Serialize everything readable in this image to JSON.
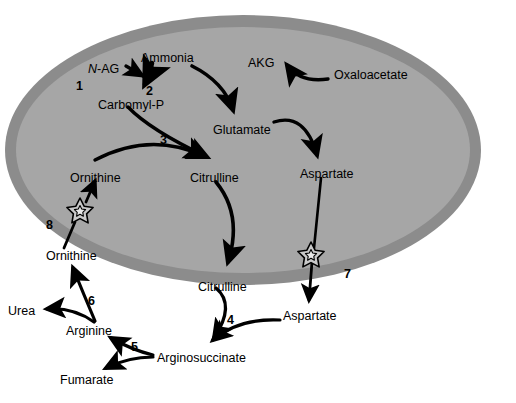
{
  "diagram": {
    "colors": {
      "membrane_outer": "#8c8c8c",
      "matrix_inner": "#a6a6a6",
      "star_fill": "#c9c9c9",
      "stroke": "#000000",
      "background": "#ffffff"
    },
    "organelle": {
      "name": "mitochondrion",
      "cx": 243,
      "cy": 150,
      "rx": 238,
      "ry": 135,
      "ring_thickness": 13
    },
    "metabolites_inside": [
      {
        "id": "n-ag",
        "label": "N-AG",
        "italic_prefix": "N",
        "rest": "-AG",
        "x": 88,
        "y": 63
      },
      {
        "id": "ammonia",
        "label": "Ammonia",
        "x": 141,
        "y": 52
      },
      {
        "id": "carbomyl-p",
        "label": "Carbomyl-P",
        "x": 98,
        "y": 99
      },
      {
        "id": "akg",
        "label": "AKG",
        "x": 248,
        "y": 57
      },
      {
        "id": "oxaloacetate",
        "label": "Oxaloacetate",
        "x": 334,
        "y": 69
      },
      {
        "id": "glutamate",
        "label": "Glutamate",
        "x": 213,
        "y": 124
      },
      {
        "id": "ornithine-in",
        "label": "Ornithine",
        "x": 70,
        "y": 172
      },
      {
        "id": "citrulline-in",
        "label": "Citrulline",
        "x": 190,
        "y": 172
      },
      {
        "id": "aspartate-in",
        "label": "Aspartate",
        "x": 300,
        "y": 168
      }
    ],
    "metabolites_outside": [
      {
        "id": "ornithine-out",
        "label": "Ornithine",
        "x": 46,
        "y": 250
      },
      {
        "id": "citrulline-out",
        "label": "Citrulline",
        "x": 198,
        "y": 281
      },
      {
        "id": "aspartate-out",
        "label": "Aspartate",
        "x": 283,
        "y": 310
      },
      {
        "id": "urea",
        "label": "Urea",
        "x": 8,
        "y": 305
      },
      {
        "id": "arginine",
        "label": "Arginine",
        "x": 66,
        "y": 325
      },
      {
        "id": "fumarate",
        "label": "Fumarate",
        "x": 60,
        "y": 374
      },
      {
        "id": "arginosuccinate",
        "label": "Arginosuccinate",
        "x": 157,
        "y": 352
      }
    ],
    "reaction_numbers": [
      {
        "id": "rxn-1",
        "label": "1",
        "x": 76,
        "y": 80,
        "meaning": "N-acetylglutamate synthase"
      },
      {
        "id": "rxn-2",
        "label": "2",
        "x": 146,
        "y": 85,
        "meaning": "carbamoyl phosphate synthetase I"
      },
      {
        "id": "rxn-3",
        "label": "3",
        "x": 160,
        "y": 134,
        "meaning": "ornithine transcarbamylase"
      },
      {
        "id": "rxn-4",
        "label": "4",
        "x": 227,
        "y": 314,
        "meaning": "argininosuccinate synthetase"
      },
      {
        "id": "rxn-5",
        "label": "5",
        "x": 131,
        "y": 341,
        "meaning": "argininosuccinate lyase"
      },
      {
        "id": "rxn-6",
        "label": "6",
        "x": 88,
        "y": 295,
        "meaning": "arginase"
      },
      {
        "id": "rxn-7",
        "label": "7",
        "x": 344,
        "y": 268,
        "meaning": "aspartate-glutamate carrier"
      },
      {
        "id": "rxn-8",
        "label": "8",
        "x": 46,
        "y": 219,
        "meaning": "ornithine-citrulline carrier"
      }
    ],
    "transporters": [
      {
        "id": "transporter-8",
        "x": 80,
        "y": 211,
        "r_outer": 13,
        "r_inner": 5.5,
        "number": "8"
      },
      {
        "id": "transporter-7",
        "x": 311,
        "y": 255,
        "r_outer": 13,
        "r_inner": 5.5,
        "number": "7"
      }
    ]
  }
}
